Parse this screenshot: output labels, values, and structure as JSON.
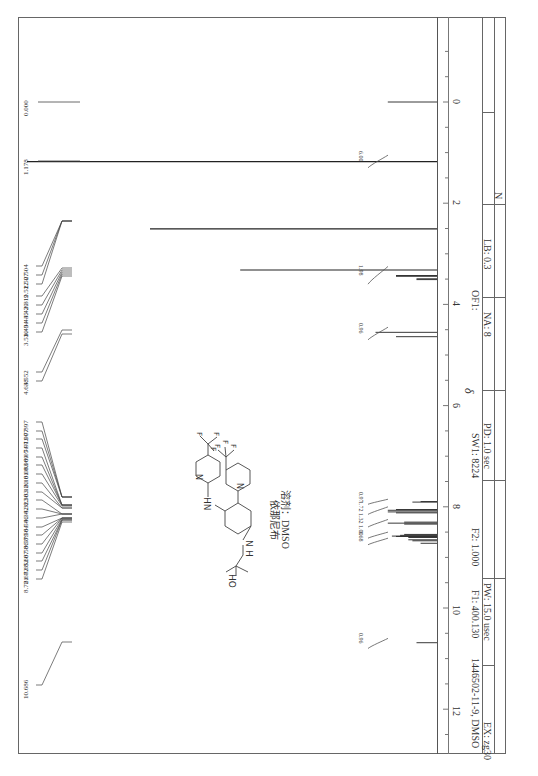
{
  "header_text": "",
  "chart_data": {
    "type": "line",
    "orientation": "rotated 90 degrees clockwise (ppm axis vertical, increasing downward)",
    "xlabel": "δ",
    "ylabel": "",
    "xlim": [
      -1.0,
      13.0
    ],
    "x_ticks": [
      0,
      2,
      4,
      6,
      8,
      10,
      12
    ],
    "x_tick_labels": [
      "0",
      "2",
      "4",
      "6",
      "8",
      "10",
      "12"
    ],
    "grid": false,
    "legend": null,
    "peak_labels": [
      "0.000",
      "1.178",
      "2.504",
      "2.507",
      "2.512",
      "3.319",
      "3.429",
      "3.445",
      "3.494",
      "3.510",
      "4.552",
      "4.638",
      "7.897",
      "7.907",
      "7.911",
      "8.054",
      "8.069",
      "8.083",
      "8.101",
      "8.120",
      "8.303",
      "8.323",
      "8.342",
      "8.546",
      "8.564",
      "8.579",
      "8.586",
      "8.607",
      "8.652",
      "8.672",
      "8.721",
      "10.686"
    ],
    "peaks": [
      {
        "ppm": 0.0,
        "height": 0.12
      },
      {
        "ppm": 1.178,
        "height": 1.0
      },
      {
        "ppm": 2.507,
        "height": 0.7
      },
      {
        "ppm": 3.319,
        "height": 0.48
      },
      {
        "ppm": 3.429,
        "height": 0.1
      },
      {
        "ppm": 3.445,
        "height": 0.1
      },
      {
        "ppm": 3.494,
        "height": 0.05
      },
      {
        "ppm": 3.51,
        "height": 0.05
      },
      {
        "ppm": 4.552,
        "height": 0.15
      },
      {
        "ppm": 4.638,
        "height": 0.1
      },
      {
        "ppm": 7.897,
        "height": 0.04
      },
      {
        "ppm": 7.907,
        "height": 0.06
      },
      {
        "ppm": 8.054,
        "height": 0.1
      },
      {
        "ppm": 8.069,
        "height": 0.12
      },
      {
        "ppm": 8.101,
        "height": 0.12
      },
      {
        "ppm": 8.12,
        "height": 0.1
      },
      {
        "ppm": 8.303,
        "height": 0.08
      },
      {
        "ppm": 8.323,
        "height": 0.12
      },
      {
        "ppm": 8.342,
        "height": 0.08
      },
      {
        "ppm": 8.546,
        "height": 0.08
      },
      {
        "ppm": 8.564,
        "height": 0.09
      },
      {
        "ppm": 8.579,
        "height": 0.11
      },
      {
        "ppm": 8.586,
        "height": 0.1
      },
      {
        "ppm": 8.607,
        "height": 0.07
      },
      {
        "ppm": 8.652,
        "height": 0.07
      },
      {
        "ppm": 8.672,
        "height": 0.06
      },
      {
        "ppm": 8.721,
        "height": 0.04
      },
      {
        "ppm": 10.686,
        "height": 0.05
      }
    ],
    "integrals": [
      {
        "ppm_from": 1.05,
        "ppm_to": 1.3,
        "value": "6.00"
      },
      {
        "ppm_from": 3.25,
        "ppm_to": 3.6,
        "value": "1.98"
      },
      {
        "ppm_from": 4.45,
        "ppm_to": 4.7,
        "value": "0.96"
      },
      {
        "ppm_from": 7.85,
        "ppm_to": 7.95,
        "value": "0.97"
      },
      {
        "ppm_from": 8.0,
        "ppm_to": 8.15,
        "value": "1.72"
      },
      {
        "ppm_from": 8.25,
        "ppm_to": 8.4,
        "value": "1.32"
      },
      {
        "ppm_from": 8.5,
        "ppm_to": 8.62,
        "value": "1.00"
      },
      {
        "ppm_from": 8.62,
        "ppm_to": 8.75,
        "value": "1.68"
      },
      {
        "ppm_from": 10.6,
        "ppm_to": 10.8,
        "value": "0.96"
      }
    ]
  },
  "compound": {
    "name_label": "依那尼布",
    "solvent_label": "溶剂：DMSO",
    "atom_labels": {
      "hn": "HN",
      "nh": "N",
      "h": "H",
      "ho": "HO",
      "n": "N",
      "f": "F"
    }
  },
  "axis": {
    "delta_label": "δ"
  },
  "params": {
    "sample": "1446502-11-9, DMSO",
    "sf": "F1: 400.130",
    "f2": "F2: 1.000",
    "sw": "SW1: 8224",
    "of": "OF1:",
    "ex": "EX: zg30",
    "pw": "PW: 15.0 usec",
    "pd": "PD: 1.0  sec",
    "na": "NA: 8",
    "lb": "LB: 0.3",
    "n": "N"
  }
}
